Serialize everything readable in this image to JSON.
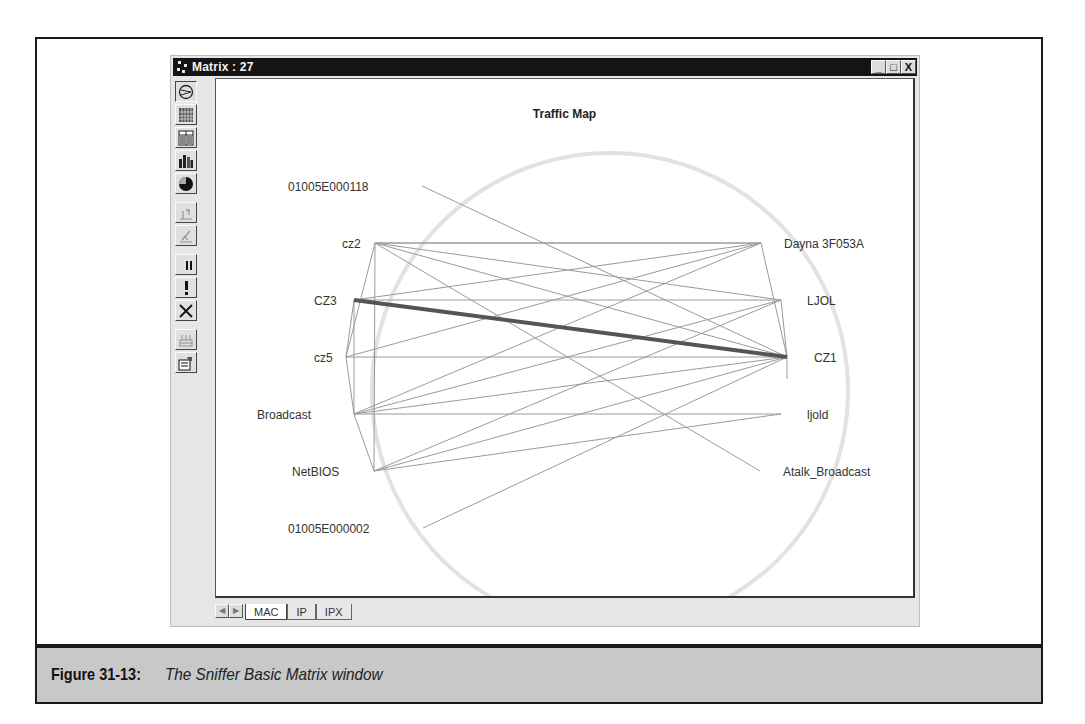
{
  "figure": {
    "caption_label": "Figure 31-13:",
    "caption_text": "The Sniffer Basic Matrix window"
  },
  "window": {
    "title": "Matrix : 27",
    "controls": {
      "minimize": "_",
      "maximize": "□",
      "close": "X"
    }
  },
  "toolbar": {
    "buttons": [
      {
        "icon": "traffic-map-icon",
        "state": "pressed"
      },
      {
        "icon": "outline-grid-icon",
        "state": "normal"
      },
      {
        "icon": "detail-table-icon",
        "state": "normal"
      },
      {
        "icon": "bar-chart-icon",
        "state": "normal"
      },
      {
        "icon": "pie-chart-icon",
        "state": "normal"
      },
      {
        "icon": "sort-icon",
        "state": "disabled"
      },
      {
        "icon": "filter-icon",
        "state": "disabled"
      },
      {
        "icon": "pause-icon",
        "state": "normal"
      },
      {
        "icon": "alert-icon",
        "state": "normal"
      },
      {
        "icon": "clear-icon",
        "state": "normal"
      },
      {
        "icon": "network-icon",
        "state": "disabled"
      },
      {
        "icon": "properties-icon",
        "state": "normal"
      }
    ]
  },
  "traffic_map": {
    "title": "Traffic Map",
    "nodes": [
      {
        "id": "01005E000118",
        "label": "01005E000118",
        "side": "left"
      },
      {
        "id": "cz2",
        "label": "cz2",
        "side": "left"
      },
      {
        "id": "CZ3",
        "label": "CZ3",
        "side": "left"
      },
      {
        "id": "cz5",
        "label": "cz5",
        "side": "left"
      },
      {
        "id": "Broadcast",
        "label": "Broadcast",
        "side": "left"
      },
      {
        "id": "NetBIOS",
        "label": "NetBIOS",
        "side": "left"
      },
      {
        "id": "01005E000002",
        "label": "01005E000002",
        "side": "left"
      },
      {
        "id": "Dayna3F053A",
        "label": "Dayna 3F053A",
        "side": "right"
      },
      {
        "id": "LJOL",
        "label": "LJOL",
        "side": "right"
      },
      {
        "id": "CZ1",
        "label": "CZ1",
        "side": "right"
      },
      {
        "id": "ljold",
        "label": "ljold",
        "side": "right"
      },
      {
        "id": "Atalk_Broadcast",
        "label": "Atalk_Broadcast",
        "side": "right"
      }
    ],
    "heaviest_link": {
      "from": "CZ3",
      "to": "CZ1"
    }
  },
  "tabs": {
    "items": [
      {
        "label": "MAC",
        "active": true
      },
      {
        "label": "IP",
        "active": false
      },
      {
        "label": "IPX",
        "active": false
      }
    ]
  }
}
